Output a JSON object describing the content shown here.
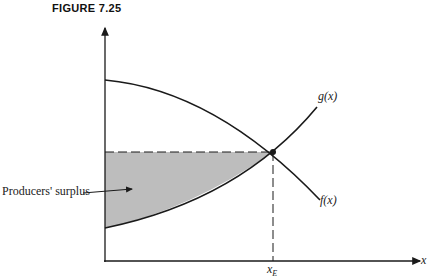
{
  "figure": {
    "title": "FIGURE 7.25"
  },
  "labels": {
    "region": "Producers' surplus",
    "curve_g": "g(x)",
    "curve_f": "f(x)",
    "x_axis": "x",
    "equilibrium_x": "x",
    "equilibrium_sub": "E"
  },
  "colors": {
    "shade": "#bdbdbd",
    "line": "#1a1a1a"
  }
}
